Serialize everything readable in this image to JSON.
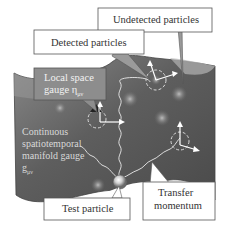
{
  "diagram": {
    "labels": {
      "undetected": "Undetected particles",
      "detected": "Detected particles",
      "local_space_line1": "Local space",
      "local_space_line2": "gauge η",
      "local_space_sub": "μν",
      "continuous_line1": "Continuous",
      "continuous_line2": "spatiotemporal",
      "continuous_line3": "manifold gauge",
      "continuous_line4": "g",
      "continuous_sub": "μν",
      "test_particle": "Test particle",
      "transfer_line1": "Transfer",
      "transfer_line2": "momentum"
    },
    "colors": {
      "manifold_dark": "#5a5a5a",
      "manifold_mid": "#7a7a7a",
      "manifold_light": "#a9a9a9",
      "callout_border": "#555555",
      "callout_fill": "#ffffff",
      "local_box_fill": "#8d8d8d",
      "glow": "#b0b0b0",
      "arrow": "#ffffff"
    }
  }
}
